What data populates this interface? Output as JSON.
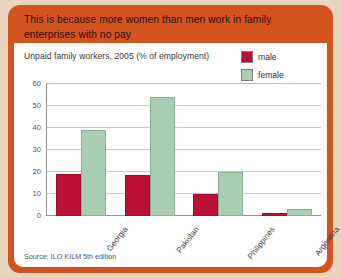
{
  "card": {
    "header_text": "This is because more women than men work in family enterprises with no pay",
    "background_color": "#d4541f",
    "page_background_color": "#e8d5bf"
  },
  "chart_panel": {
    "source_note": "Source: ILO KILM 5th edition"
  },
  "legend": {
    "items": [
      {
        "label": "male",
        "color": "#bd1133"
      },
      {
        "label": "female",
        "color": "#a9ceb2"
      }
    ]
  },
  "chart_data": {
    "type": "bar",
    "title": "Unpaid family workers, 2005  (% of employment)",
    "xlabel": "",
    "ylabel": "",
    "ylim": [
      0,
      60
    ],
    "yticks": [
      0,
      10,
      20,
      30,
      40,
      50,
      60
    ],
    "grid": true,
    "legend_position": "top-right",
    "categories": [
      "Georgia",
      "Pakistan",
      "Philippines",
      "Argentina"
    ],
    "series": [
      {
        "name": "male",
        "color": "#bd1133",
        "values": [
          19,
          18.5,
          10,
          1.5
        ]
      },
      {
        "name": "female",
        "color": "#a9ceb2",
        "values": [
          39,
          54,
          20,
          3
        ]
      }
    ]
  }
}
